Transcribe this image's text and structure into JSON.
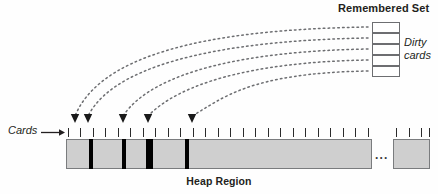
{
  "diagram": {
    "title_remembered_set": "Remembered Set",
    "label_dirty_cards_line1": "Dirty",
    "label_dirty_cards_line2": "cards",
    "label_cards": "Cards",
    "label_heap_region": "Heap Region",
    "ellipsis": "...",
    "colors": {
      "card_fill": "#cfcfcf",
      "card_border": "#7a7c7e",
      "dirty_card_marker": "#000000",
      "text": "#231f20",
      "dotted_line": "#6d6e71",
      "remembered_set_border": "#6d6e71",
      "background": "#fefefe"
    },
    "remembered_set": {
      "count": 5,
      "box_x": 372,
      "box_width": 28,
      "box_height": 11,
      "tops": [
        22,
        33,
        44,
        55,
        66
      ]
    },
    "heap_bar": {
      "main": {
        "x": 66,
        "y": 139,
        "width": 306,
        "height": 30
      },
      "tail": {
        "x": 393,
        "y": 139,
        "width": 37,
        "height": 30
      },
      "dirty_dividers": [
        {
          "x": 89,
          "width": 4
        },
        {
          "x": 122,
          "width": 4
        },
        {
          "x": 146,
          "width": 7
        },
        {
          "x": 185,
          "width": 4
        }
      ]
    },
    "ticks": {
      "y": 128,
      "main_xs": [
        68,
        80,
        93,
        105,
        118,
        130,
        143,
        155,
        168,
        180,
        193,
        205,
        218,
        230,
        243,
        255,
        268,
        280,
        293,
        305,
        318,
        330,
        343,
        355,
        368
      ],
      "tail_xs": [
        396,
        409,
        421,
        429
      ]
    },
    "arrows": {
      "count": 5,
      "target_xs": [
        75,
        88,
        123,
        148,
        192
      ],
      "target_y": 122,
      "source_xs": [
        368,
        368,
        368,
        368,
        368
      ],
      "source_ys": [
        27,
        38,
        49,
        60,
        71
      ]
    }
  }
}
